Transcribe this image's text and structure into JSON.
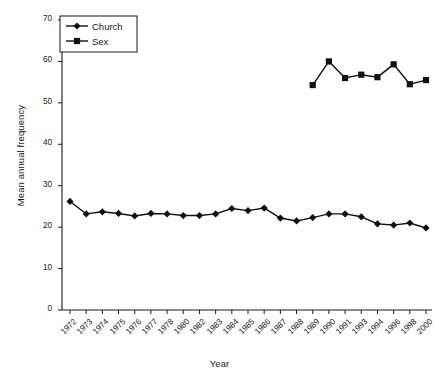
{
  "chart_data": {
    "type": "line",
    "title": "",
    "subtitle": "",
    "xlabel": "Year",
    "ylabel": "Mean annual frequency",
    "grid": false,
    "legend_position": "top-left",
    "ylim": [
      0,
      70
    ],
    "yticks": [
      0,
      10,
      20,
      30,
      40,
      50,
      60,
      70
    ],
    "categories": [
      "1972",
      "1973",
      "1974",
      "1975",
      "1976",
      "1977",
      "1978",
      "1980",
      "1982",
      "1983",
      "1984",
      "1985",
      "1986",
      "1987",
      "1988",
      "1989",
      "1990",
      "1991",
      "1993",
      "1994",
      "1996",
      "1998",
      "2000"
    ],
    "series": [
      {
        "name": "Church",
        "marker": "diamond",
        "color": "#111111",
        "values": [
          26.2,
          23.2,
          23.7,
          23.3,
          22.7,
          23.3,
          23.2,
          22.8,
          22.8,
          23.2,
          24.5,
          24.0,
          24.6,
          22.2,
          21.5,
          22.3,
          23.2,
          23.2,
          22.5,
          20.8,
          20.5,
          21.0,
          19.8
        ]
      },
      {
        "name": "Sex",
        "marker": "square",
        "color": "#111111",
        "values": [
          null,
          null,
          null,
          null,
          null,
          null,
          null,
          null,
          null,
          null,
          null,
          null,
          null,
          null,
          null,
          54.3,
          60.0,
          56.0,
          56.8,
          56.2,
          59.3,
          54.5,
          55.5
        ]
      }
    ]
  },
  "legend": {
    "entries": [
      {
        "label": "Church",
        "marker": "diamond"
      },
      {
        "label": "Sex",
        "marker": "square"
      }
    ]
  },
  "axes": {
    "x_title": "Year",
    "y_title": "Mean annual frequency"
  }
}
